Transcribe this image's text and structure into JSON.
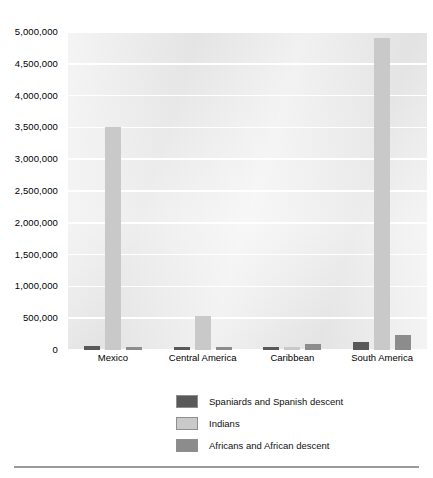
{
  "chart_data": {
    "type": "bar",
    "title": "",
    "subtitle": "",
    "xlabel": "",
    "ylabel": "",
    "categories": [
      "Mexico",
      "Central America",
      "Caribbean",
      "South America"
    ],
    "series": [
      {
        "name": "Spaniards and Spanish descent",
        "color": "#595959",
        "values": [
          60000,
          10000,
          20000,
          120000
        ]
      },
      {
        "name": "Indians",
        "color": "#c9c9c9",
        "values": [
          3500000,
          530000,
          20000,
          4900000
        ]
      },
      {
        "name": "Africans and African descent",
        "color": "#8c8c8c",
        "values": [
          20000,
          20000,
          90000,
          230000
        ]
      }
    ],
    "ylim": [
      0,
      5000000
    ],
    "ytick_values": [
      0,
      500000,
      1000000,
      1500000,
      2000000,
      2500000,
      3000000,
      3500000,
      4000000,
      4500000,
      5000000
    ],
    "ytick_labels": [
      "0",
      "500,000",
      "1,000,000",
      "1,500,000",
      "2,000,000",
      "2,500,000",
      "3,000,000",
      "3,500,000",
      "4,000,000",
      "4,500,000",
      "5,000,000"
    ],
    "grid": true,
    "grid_color": "#ffffff",
    "plot_background": "#ebebeb",
    "legend_position": "bottom-center",
    "legend_entries": [
      "Spaniards and Spanish descent",
      "Indians",
      "Africans and African descent"
    ]
  }
}
